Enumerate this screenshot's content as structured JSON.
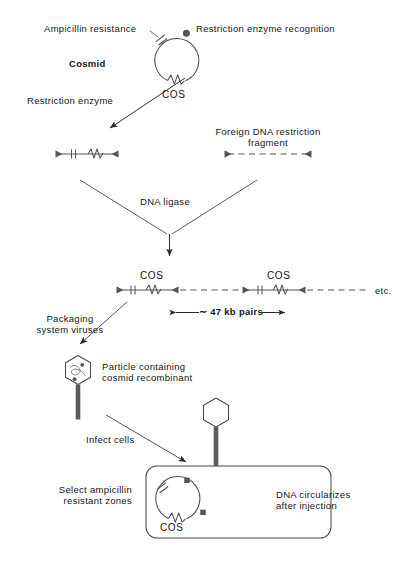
{
  "diagram": {
    "colors": {
      "ink": "#161616",
      "line": "#4a4a4a",
      "dna_dark": "#555555",
      "tail": "#5a5a5a",
      "background": "#ffffff"
    },
    "labels": {
      "ampicillin_resistance": "Ampicillin resistance",
      "restriction_enzyme_recognition": "Restriction enzyme recognition",
      "cosmid": "Cosmid",
      "cos_cosmid": "COS",
      "restriction_enzyme": "Restriction enzyme",
      "foreign_dna_line1": "Foreign DNA restriction",
      "foreign_dna_line2": "fragment",
      "dna_ligase": "DNA ligase",
      "cos_left": "COS",
      "cos_right": "COS",
      "etc": "etc.",
      "kb_pairs": "∼ 47 kb pairs",
      "packaging_line1": "Packaging",
      "packaging_line2": "system viruses",
      "particle_line1": "Particle containing",
      "particle_line2": "cosmid recombinant",
      "infect_cells": "Infect cells",
      "select_line1": "Select ampicillin",
      "select_line2": "resistant zones",
      "cos_cell": "COS",
      "circularizes_line1": "DNA circularizes",
      "circularizes_line2": "after injection"
    },
    "icons": {
      "cosmid_plasmid": "circular-dna-icon",
      "restriction_site_dot": "restriction-site-dot-icon",
      "ampicillin_hatch": "hatch-marks-icon",
      "cos_zigzag": "cos-zigzag-icon",
      "linear_cosmid": "linear-dna-icon",
      "foreign_fragment": "dashed-dna-icon",
      "phage_loaded": "phage-particle-icon",
      "phage_empty": "empty-phage-icon",
      "host_cell": "host-cell-icon",
      "arrow_down": "arrow-down-icon",
      "arrow_diagonal": "arrow-diagonal-icon",
      "arrow_double": "double-headed-arrow-icon"
    }
  }
}
